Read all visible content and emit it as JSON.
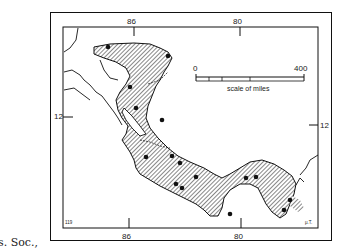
{
  "side_text": {
    "line1": "p. 136",
    "line2": "p. 136",
    "line3": "s. Soc.,"
  },
  "map": {
    "longitude_ticks_top": [
      "86",
      "80"
    ],
    "longitude_ticks_bottom": [
      "86",
      "80"
    ],
    "latitude_ticks_left": [
      "12"
    ],
    "latitude_ticks_right": [
      "12"
    ],
    "scale_bar": {
      "start_label": "0",
      "end_label": "400",
      "caption": "scale of miles"
    },
    "corner_label_left": "119",
    "corner_label_right": "μ.T.",
    "fill_pattern": "diagonal-hatch",
    "colors": {
      "hatch": "#555555",
      "outline": "#111111",
      "background": "#ffffff"
    }
  }
}
